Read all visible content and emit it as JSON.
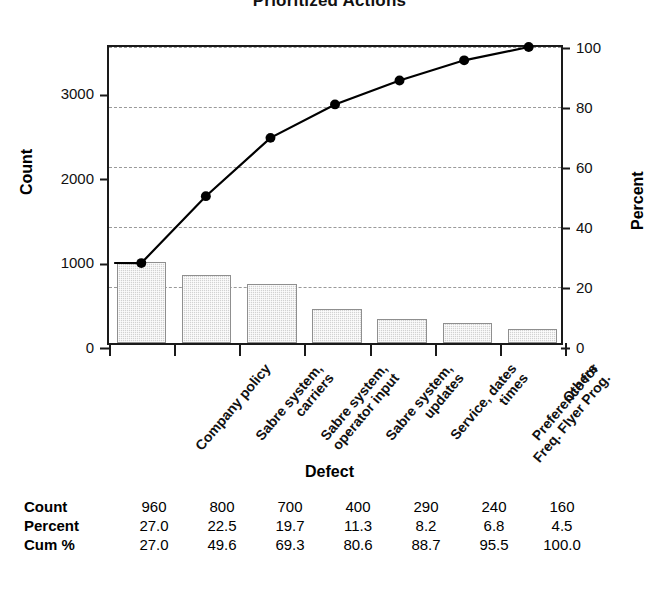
{
  "chart_data": {
    "type": "bar",
    "title": "Prioritized Actions",
    "xlabel": "Defect",
    "ylabel": "Count",
    "y2label": "Percent",
    "categories": [
      "Company policy",
      "Sabre system,\ncarriers",
      "Sabre system,\noperator input",
      "Sabre system,\nupdates",
      "Service, dates\ntimes",
      "Preference for\nFreq. Flyer Prog.",
      "Others"
    ],
    "values": [
      960,
      800,
      700,
      400,
      290,
      240,
      160
    ],
    "percent": [
      27.0,
      22.5,
      19.7,
      11.3,
      8.2,
      6.8,
      4.5
    ],
    "cum_percent": [
      27.0,
      49.6,
      69.3,
      80.6,
      88.7,
      95.5,
      100.0
    ],
    "ylim": [
      0,
      3550
    ],
    "y2lim": [
      0,
      100
    ],
    "yticks": [
      0,
      1000,
      2000,
      3000
    ],
    "y2ticks": [
      0,
      20,
      40,
      60,
      80,
      100
    ],
    "grid": true,
    "grid_axis": "y2",
    "legend": "none",
    "bar_color": "#d2d2d2",
    "line_color": "#000000",
    "marker": "filled-circle"
  },
  "table": {
    "rows": [
      {
        "header": "Count",
        "cells": [
          "960",
          "800",
          "700",
          "400",
          "290",
          "240",
          "160"
        ]
      },
      {
        "header": "Percent",
        "cells": [
          "27.0",
          "22.5",
          "19.7",
          "11.3",
          "8.2",
          "6.8",
          "4.5"
        ]
      },
      {
        "header": "Cum %",
        "cells": [
          "27.0",
          "49.6",
          "69.3",
          "80.6",
          "88.7",
          "95.5",
          "100.0"
        ]
      }
    ]
  },
  "axes": {
    "left_ticks": [
      "3000",
      "2000",
      "1000",
      "0"
    ],
    "right_ticks": [
      "100",
      "80",
      "60",
      "40",
      "20",
      "0"
    ]
  }
}
